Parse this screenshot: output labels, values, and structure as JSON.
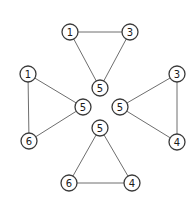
{
  "diagram": {
    "node_radius": 8,
    "colors": {
      "edge": "#6e6e6e",
      "node_stroke": "#3a3a3a",
      "node_fill": "#ffffff",
      "text": "#1a1a1a"
    },
    "triangles": [
      {
        "name": "top",
        "nodes": [
          {
            "label": "1",
            "x": 70,
            "y": 32
          },
          {
            "label": "3",
            "x": 130,
            "y": 32
          },
          {
            "label": "5",
            "x": 100,
            "y": 88
          }
        ]
      },
      {
        "name": "left",
        "nodes": [
          {
            "label": "1",
            "x": 28,
            "y": 74
          },
          {
            "label": "5",
            "x": 83,
            "y": 107
          },
          {
            "label": "6",
            "x": 29,
            "y": 141
          }
        ]
      },
      {
        "name": "right",
        "nodes": [
          {
            "label": "3",
            "x": 177,
            "y": 74
          },
          {
            "label": "5",
            "x": 120,
            "y": 107
          },
          {
            "label": "4",
            "x": 177,
            "y": 142
          }
        ]
      },
      {
        "name": "bottom",
        "nodes": [
          {
            "label": "5",
            "x": 100,
            "y": 128
          },
          {
            "label": "6",
            "x": 69,
            "y": 183
          },
          {
            "label": "4",
            "x": 132,
            "y": 183
          }
        ]
      }
    ]
  }
}
